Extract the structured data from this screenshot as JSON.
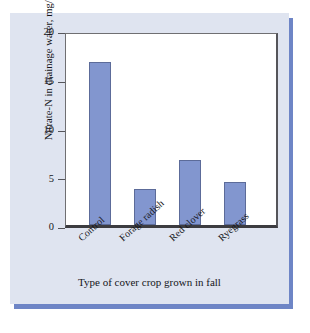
{
  "chart_data": {
    "type": "bar",
    "title": "",
    "subtitle": "",
    "xlabel": "Type of cover crop grown in fall",
    "ylabel": "Nitrate-N in drainage water, mg/L",
    "categories": [
      "Control",
      "Forage radish",
      "Red clover",
      "Ryegrass"
    ],
    "values": [
      17.1,
      3.8,
      6.8,
      4.5
    ],
    "ylim": [
      0,
      20
    ],
    "yticks": [
      0,
      5,
      10,
      15,
      20
    ],
    "ytick_labels": [
      "0",
      "5",
      "10",
      "15",
      "20"
    ],
    "grid": false,
    "legend": "none",
    "bar_color": "#8296cf",
    "bar_edge_color": "#5c6b99",
    "panel_background": "#dfe4f0",
    "plot_background": "#ffffff",
    "shadow_color": "#6e85c6",
    "axis_color": "#3c3c40"
  }
}
